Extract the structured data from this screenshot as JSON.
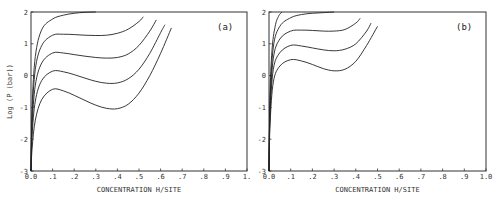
{
  "chart_data": [
    {
      "type": "line",
      "panel_label": "(a)",
      "xlabel": "CONCENTRATION H/SITE",
      "ylabel": "Log (P (bar))",
      "xlim": [
        0.0,
        1.0
      ],
      "ylim": [
        -3,
        2
      ],
      "x_tick_labels": [
        "0.0",
        ".1",
        ".2",
        ".3",
        ".4",
        ".5",
        ".6",
        ".7",
        ".8",
        ".9",
        "1."
      ],
      "y_tick_labels": [
        "-3",
        "-2",
        "-1",
        "0",
        "1",
        "2"
      ],
      "grid": false,
      "legend": null,
      "series": [
        {
          "name": "isotherm-1",
          "x": [
            0.0,
            0.005,
            0.02,
            0.05,
            0.1,
            0.15,
            0.2,
            0.25,
            0.3
          ],
          "y": [
            -3.0,
            -1.0,
            0.6,
            1.45,
            1.78,
            1.9,
            1.96,
            1.99,
            2.0
          ]
        },
        {
          "name": "isotherm-2",
          "x": [
            0.0,
            0.005,
            0.02,
            0.05,
            0.1,
            0.15,
            0.2,
            0.25,
            0.3,
            0.35,
            0.4,
            0.45,
            0.5,
            0.52
          ],
          "y": [
            -3.0,
            -1.3,
            0.2,
            0.95,
            1.27,
            1.3,
            1.29,
            1.27,
            1.26,
            1.27,
            1.33,
            1.46,
            1.7,
            1.85
          ]
        },
        {
          "name": "isotherm-3",
          "x": [
            0.0,
            0.005,
            0.02,
            0.05,
            0.1,
            0.15,
            0.2,
            0.25,
            0.3,
            0.35,
            0.4,
            0.45,
            0.5,
            0.55,
            0.58
          ],
          "y": [
            -3.0,
            -1.6,
            -0.3,
            0.4,
            0.71,
            0.71,
            0.66,
            0.61,
            0.57,
            0.55,
            0.57,
            0.68,
            0.95,
            1.4,
            1.75
          ]
        },
        {
          "name": "isotherm-4",
          "x": [
            0.0,
            0.005,
            0.02,
            0.05,
            0.1,
            0.15,
            0.2,
            0.25,
            0.3,
            0.35,
            0.4,
            0.45,
            0.5,
            0.55,
            0.6,
            0.62
          ],
          "y": [
            -3.0,
            -1.9,
            -0.8,
            -0.15,
            0.14,
            0.12,
            0.03,
            -0.08,
            -0.18,
            -0.24,
            -0.23,
            -0.1,
            0.2,
            0.7,
            1.35,
            1.6
          ]
        },
        {
          "name": "isotherm-5",
          "x": [
            0.0,
            0.005,
            0.02,
            0.05,
            0.1,
            0.15,
            0.2,
            0.25,
            0.3,
            0.35,
            0.4,
            0.45,
            0.5,
            0.55,
            0.6,
            0.65
          ],
          "y": [
            -3.0,
            -2.3,
            -1.4,
            -0.75,
            -0.43,
            -0.48,
            -0.62,
            -0.78,
            -0.93,
            -1.03,
            -1.04,
            -0.9,
            -0.55,
            -0.0,
            0.7,
            1.5
          ]
        }
      ]
    },
    {
      "type": "line",
      "panel_label": "(b)",
      "xlabel": "CONCENTRATION H/SITE",
      "ylabel": "",
      "xlim": [
        0.0,
        1.0
      ],
      "ylim": [
        -3,
        2
      ],
      "x_tick_labels": [
        "0.0",
        ".1",
        ".2",
        ".3",
        ".4",
        ".5",
        ".6",
        ".7",
        ".8",
        ".9",
        "1.0"
      ],
      "y_tick_labels": [
        "-3",
        "-2",
        "-1",
        "0",
        "1",
        "2"
      ],
      "grid": false,
      "legend": null,
      "series": [
        {
          "name": "isotherm-1",
          "x": [
            0.0,
            0.005,
            0.015,
            0.03,
            0.045,
            0.06
          ],
          "y": [
            -3.0,
            -0.5,
            0.9,
            1.6,
            1.88,
            2.0
          ]
        },
        {
          "name": "isotherm-2",
          "x": [
            0.0,
            0.005,
            0.02,
            0.05,
            0.1,
            0.15,
            0.2,
            0.25,
            0.3
          ],
          "y": [
            -3.0,
            -0.8,
            0.9,
            1.55,
            1.82,
            1.92,
            1.96,
            1.98,
            2.0
          ]
        },
        {
          "name": "isotherm-3",
          "x": [
            0.0,
            0.005,
            0.02,
            0.05,
            0.1,
            0.15,
            0.2,
            0.25,
            0.3,
            0.35,
            0.4,
            0.42
          ],
          "y": [
            -3.0,
            -1.0,
            0.55,
            1.15,
            1.4,
            1.43,
            1.42,
            1.4,
            1.4,
            1.45,
            1.65,
            1.8
          ]
        },
        {
          "name": "isotherm-4",
          "x": [
            0.0,
            0.005,
            0.02,
            0.05,
            0.1,
            0.15,
            0.2,
            0.25,
            0.3,
            0.35,
            0.4,
            0.45,
            0.47
          ],
          "y": [
            -3.0,
            -1.2,
            0.2,
            0.72,
            0.95,
            0.93,
            0.87,
            0.81,
            0.78,
            0.83,
            1.0,
            1.4,
            1.65
          ]
        },
        {
          "name": "isotherm-5",
          "x": [
            0.0,
            0.005,
            0.02,
            0.05,
            0.1,
            0.15,
            0.2,
            0.25,
            0.3,
            0.35,
            0.4,
            0.45,
            0.5
          ],
          "y": [
            -3.0,
            -1.5,
            -0.2,
            0.3,
            0.5,
            0.46,
            0.35,
            0.22,
            0.15,
            0.2,
            0.45,
            0.95,
            1.55
          ]
        }
      ]
    }
  ],
  "layout": {
    "panels": [
      {
        "left": 31,
        "top": 12,
        "right": 247,
        "bottom": 171
      },
      {
        "left": 269,
        "top": 12,
        "right": 486,
        "bottom": 171
      }
    ],
    "line_color": "#222222",
    "frame_color": "#333333",
    "background": "#ffffff"
  }
}
